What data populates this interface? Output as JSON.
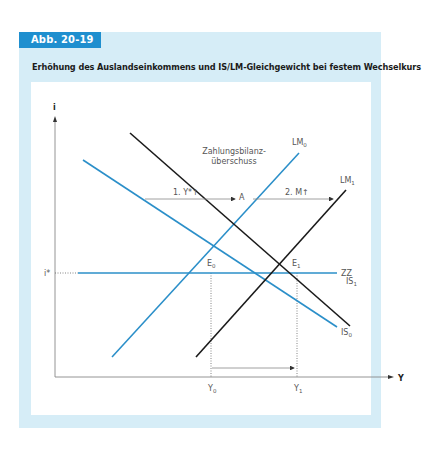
{
  "figure": {
    "tab_label": "Abb. 20-19",
    "title": "Erhöhung des Auslandseinkommens und IS/LM-Gleichgewicht bei festem Wechselkurs"
  },
  "colors": {
    "panel_bg": "#d6edf7",
    "tab_bg": "#1f8fcf",
    "blue_line": "#2b8fc9",
    "black_line": "#1a1a1a",
    "axis": "#888888"
  },
  "axes": {
    "y_label": "i",
    "x_label": "Y",
    "i_star_label": "i*"
  },
  "curves": {
    "is0": "IS",
    "is0_sub": "0",
    "is1": "IS",
    "is1_sub": "1",
    "lm0": "LM",
    "lm0_sub": "0",
    "lm1": "LM",
    "lm1_sub": "1",
    "zz": "ZZ"
  },
  "points": {
    "e0": "E",
    "e0_sub": "0",
    "e1": "E",
    "e1_sub": "1",
    "a": "A"
  },
  "x_ticks": {
    "y0": "Y",
    "y0_sub": "0",
    "y1": "Y",
    "y1_sub": "1"
  },
  "annotations": {
    "step1": "1. Y*↑",
    "step2": "2. M↑",
    "surplus_line1": "Zahlungsbilanz-",
    "surplus_line2": "überschuss"
  }
}
